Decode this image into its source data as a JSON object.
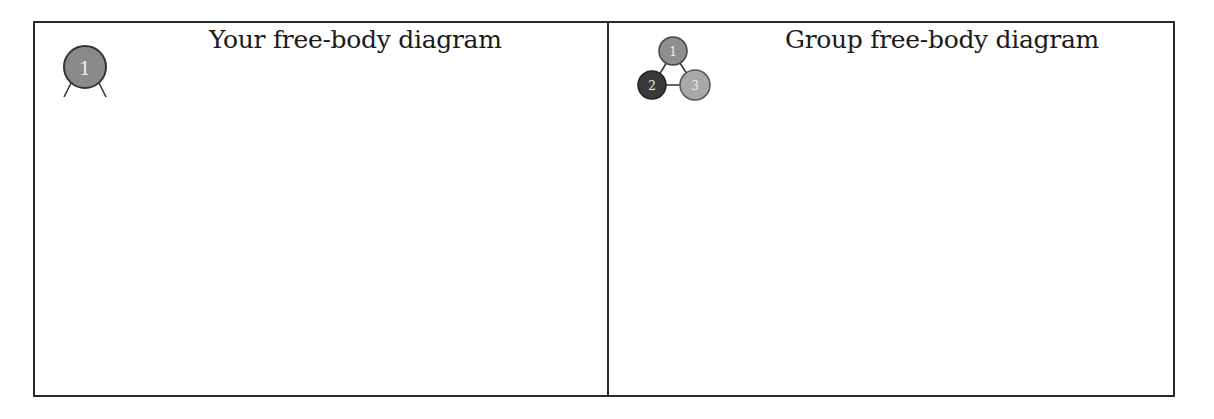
{
  "cells": [
    {
      "title": "Your free-body diagram",
      "icon": {
        "name": "single-body-icon",
        "label": "1",
        "color": "#8a8a8a"
      }
    },
    {
      "title": "Group free-body diagram",
      "icon": {
        "name": "group-bodies-icon",
        "nodes": [
          {
            "label": "1",
            "color": "#8f8f8f"
          },
          {
            "label": "2",
            "color": "#3a3a3a"
          },
          {
            "label": "3",
            "color": "#a8a8a8"
          }
        ]
      }
    }
  ],
  "colors": {
    "border": "#2a2a2a",
    "text": "#1a1a1a"
  }
}
